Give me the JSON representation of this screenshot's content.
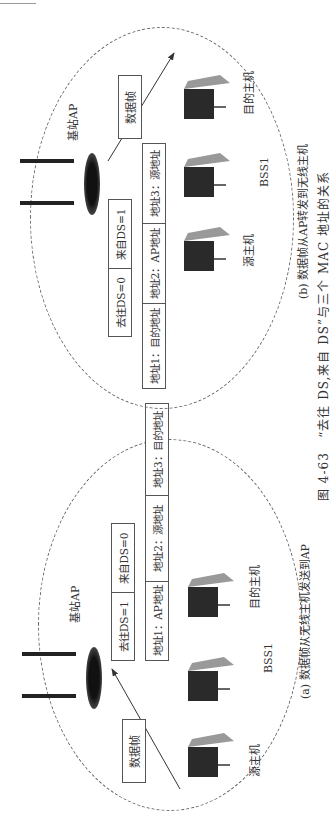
{
  "figure": {
    "number": "图 4-63",
    "title": "“去往 DS,来自 DS”与三个 MAC 地址的关系"
  },
  "panel_a": {
    "caption": "(a) 数据帧从无线主机发送到AP",
    "ap_label": "基站AP",
    "frame_label": "数据帧",
    "bss_label": "BSS1",
    "hosts": [
      "源主机",
      "",
      "目的主机"
    ],
    "ds_flags": [
      "去往DS=1",
      "来自DS=0"
    ],
    "addresses": [
      "地址1：AP地址",
      "地址2：源地址",
      "地址3：目的地址"
    ],
    "arrow": "源主机 → 基站AP"
  },
  "panel_b": {
    "caption": "(b) 数据帧从AP转发到无线主机",
    "ap_label": "基站AP",
    "frame_label": "数据帧",
    "bss_label": "BSS1",
    "hosts": [
      "源主机",
      "",
      "目的主机"
    ],
    "ds_flags": [
      "去往DS=0",
      "来自DS=1"
    ],
    "addresses": [
      "地址1：目的地址",
      "地址2：AP地址",
      "地址3：源地址"
    ],
    "arrow": "基站AP → 目的主机"
  },
  "colors": {
    "line": "#555555",
    "dashed": "#666666",
    "text": "#333333"
  }
}
